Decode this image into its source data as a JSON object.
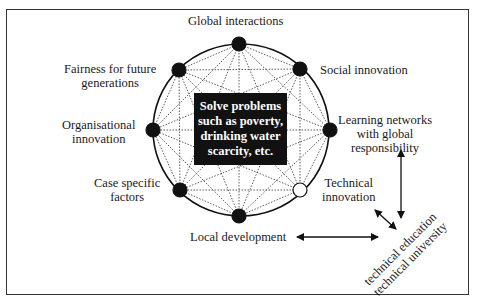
{
  "diagram": {
    "nodes": [
      {
        "id": "global",
        "label": "Global interactions",
        "x": 239,
        "y": 44,
        "filled": true
      },
      {
        "id": "social",
        "label": "Social innovation",
        "x": 300,
        "y": 69,
        "filled": true
      },
      {
        "id": "learning",
        "label": "Learning networks with global responsibility",
        "x": 330,
        "y": 130,
        "filled": true
      },
      {
        "id": "technical",
        "label": "Technical innovation",
        "x": 300,
        "y": 190,
        "filled": false
      },
      {
        "id": "local",
        "label": "Local development",
        "x": 239,
        "y": 216,
        "filled": true
      },
      {
        "id": "case",
        "label": "Case specific factors",
        "x": 180,
        "y": 190,
        "filled": true
      },
      {
        "id": "org",
        "label": "Organisational innovation",
        "x": 153,
        "y": 130,
        "filled": true
      },
      {
        "id": "fairness",
        "label": "Fairness for future generations",
        "x": 179,
        "y": 70,
        "filled": true
      }
    ],
    "labels": {
      "global": "Global interactions",
      "social": "Social innovation",
      "learning_1": "Learning networks",
      "learning_2": "with global",
      "learning_3": "responsibility",
      "technical_1": "Technical",
      "technical_2": "innovation",
      "local": "Local development",
      "case_1": "Case specific",
      "case_2": "factors",
      "org_1": "Organisational",
      "org_2": "innovation",
      "fairness_1": "Fairness for future",
      "fairness_2": "generations"
    },
    "center": {
      "line1": "Solve problems",
      "line2": "such as poverty,",
      "line3": "drinking water",
      "line4": "scarcity, etc."
    },
    "tech_edu": {
      "line1": "technical education",
      "line2": "technical university"
    }
  }
}
